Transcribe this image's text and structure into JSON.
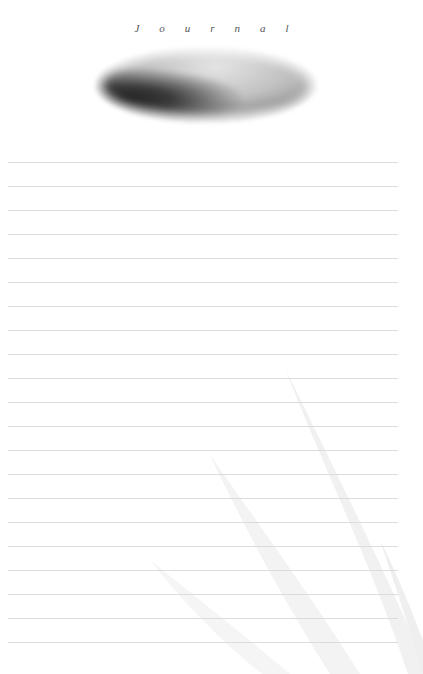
{
  "page": {
    "title": "Journal",
    "header_image": "misty-forest-landscape-oval",
    "background_decoration": "grass-blades-watermark",
    "ruled_lines": {
      "count": 21,
      "first_y": 162,
      "spacing": 24,
      "color": "#dcdcdc"
    }
  }
}
